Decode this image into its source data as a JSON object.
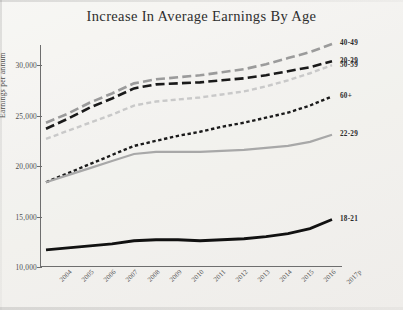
{
  "chart_data": {
    "type": "line",
    "title": "Increase In Average Earnings By Age",
    "xlabel": "",
    "ylabel": "Earnings per annum",
    "categories": [
      "2004",
      "2005",
      "2006",
      "2007",
      "2008",
      "2009",
      "2010",
      "2011",
      "2012",
      "2013",
      "2014",
      "2015",
      "2016",
      "2017p"
    ],
    "ylim": [
      10000,
      32000
    ],
    "yticks": [
      10000,
      15000,
      20000,
      25000,
      30000
    ],
    "ytick_labels": [
      "10,000",
      "15,000",
      "20,000",
      "25,000",
      "30,000"
    ],
    "grid": false,
    "legend_position": "right-inline",
    "series": [
      {
        "name": "40-49",
        "label": "40-49",
        "color": "#9b9b9b",
        "style": "long-dash",
        "width": 2.6,
        "values": [
          24300,
          25200,
          26300,
          27200,
          28200,
          28600,
          28800,
          29000,
          29300,
          29600,
          30100,
          30700,
          31300,
          32100
        ]
      },
      {
        "name": "50-59",
        "label": "50-59",
        "color": "#c9c9c9",
        "style": "dash",
        "width": 2.4,
        "values": [
          22700,
          23500,
          24300,
          25100,
          26000,
          26400,
          26600,
          26800,
          27100,
          27400,
          27900,
          28500,
          29200,
          30000
        ]
      },
      {
        "name": "30-39",
        "label": "30-39",
        "color": "#1a1a1a",
        "style": "long-dash",
        "width": 2.6,
        "values": [
          23700,
          24700,
          25800,
          26700,
          27700,
          28100,
          28200,
          28300,
          28500,
          28700,
          29000,
          29400,
          29800,
          30400
        ]
      },
      {
        "name": "60+",
        "label": "60+",
        "color": "#1a1a1a",
        "style": "short-dash",
        "width": 2.4,
        "values": [
          18400,
          19300,
          20200,
          21100,
          22000,
          22500,
          23000,
          23400,
          23900,
          24300,
          24800,
          25300,
          26000,
          26900
        ]
      },
      {
        "name": "22-29",
        "label": "22-29",
        "color": "#a8a8a8",
        "style": "solid",
        "width": 2.2,
        "values": [
          18400,
          19100,
          19800,
          20500,
          21200,
          21400,
          21400,
          21400,
          21500,
          21600,
          21800,
          22000,
          22400,
          23100
        ]
      },
      {
        "name": "18-21",
        "label": "18-21",
        "color": "#111111",
        "style": "solid",
        "width": 2.8,
        "values": [
          11700,
          11900,
          12100,
          12300,
          12600,
          12700,
          12700,
          12600,
          12700,
          12800,
          13000,
          13300,
          13800,
          14700
        ]
      }
    ]
  }
}
